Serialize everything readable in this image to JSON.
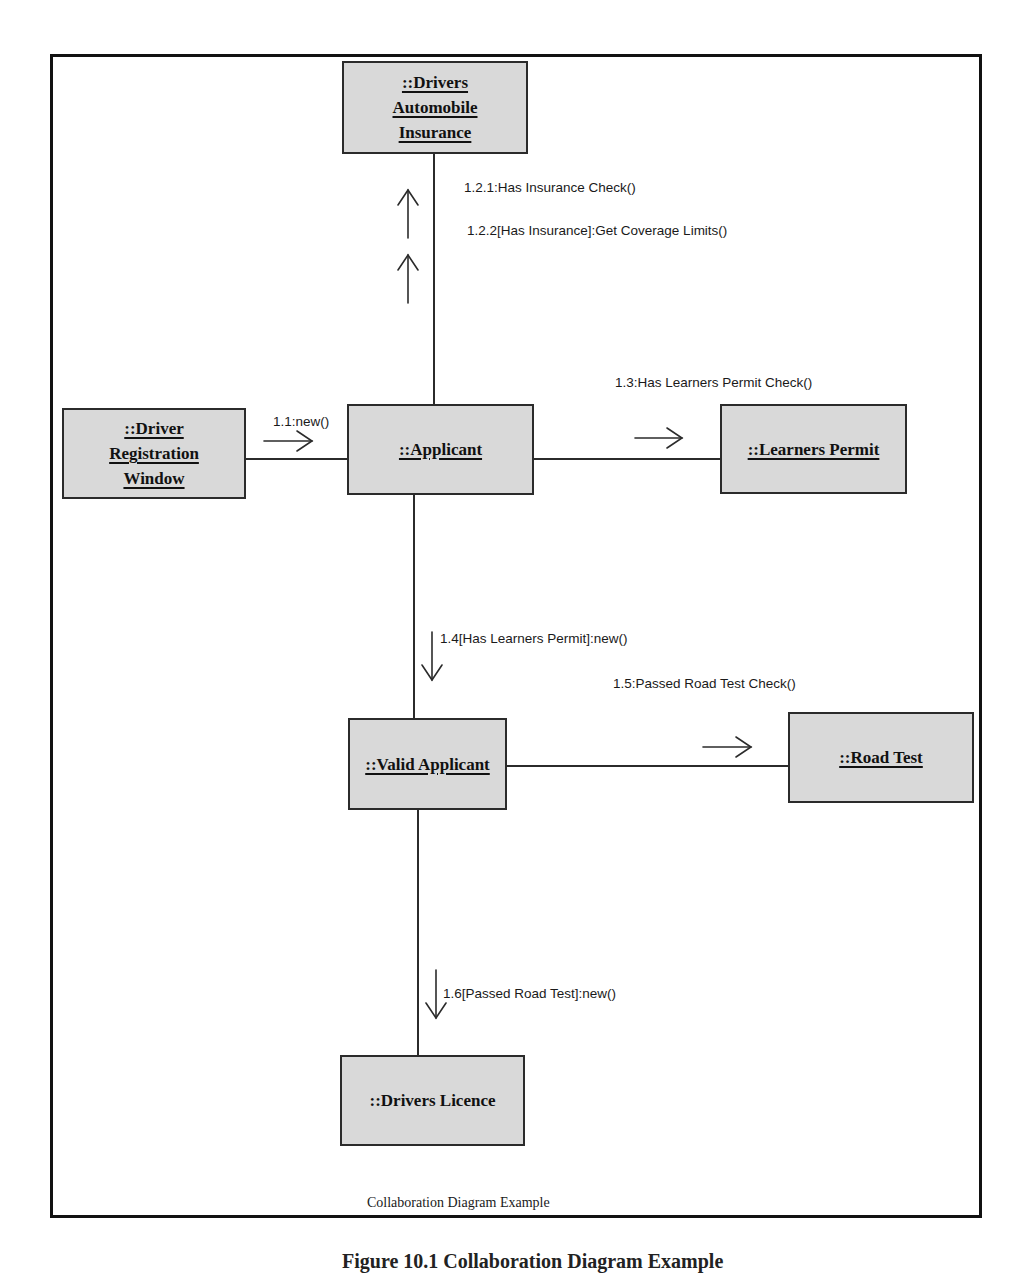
{
  "diagram": {
    "type": "UML collaboration diagram",
    "caption": "Collaboration Diagram Example",
    "figure_caption": "Figure 10.1 Collaboration Diagram Example",
    "objects": {
      "insurance": "::Drivers\nAutomobile\nInsurance",
      "registration_window": "::Driver\nRegistration\nWindow",
      "applicant": "::Applicant",
      "learners_permit": "::Learners Permit",
      "valid_applicant": "::Valid Applicant",
      "road_test": "::Road Test",
      "drivers_licence": "::Drivers Licence"
    },
    "messages": {
      "m1_1": "1.1:new()",
      "m1_2_1": "1.2.1:Has Insurance Check()",
      "m1_2_2": "1.2.2[Has Insurance]:Get Coverage Limits()",
      "m1_3": "1.3:Has Learners Permit Check()",
      "m1_4": "1.4[Has Learners Permit]:new()",
      "m1_5": "1.5:Passed Road Test Check()",
      "m1_6": "1.6[Passed Road Test]:new()"
    },
    "links": [
      {
        "from": "::Driver Registration Window",
        "to": "::Applicant",
        "message": "1.1:new()",
        "direction": "right"
      },
      {
        "from": "::Applicant",
        "to": "::Drivers Automobile Insurance",
        "message": "1.2.1:Has Insurance Check()",
        "direction": "up"
      },
      {
        "from": "::Applicant",
        "to": "::Drivers Automobile Insurance",
        "message": "1.2.2[Has Insurance]:Get Coverage Limits()",
        "direction": "up"
      },
      {
        "from": "::Applicant",
        "to": "::Learners Permit",
        "message": "1.3:Has Learners Permit Check()",
        "direction": "right"
      },
      {
        "from": "::Applicant",
        "to": "::Valid Applicant",
        "message": "1.4[Has Learners Permit]:new()",
        "direction": "down"
      },
      {
        "from": "::Valid Applicant",
        "to": "::Road Test",
        "message": "1.5:Passed Road Test Check()",
        "direction": "right"
      },
      {
        "from": "::Valid Applicant",
        "to": "::Drivers Licence",
        "message": "1.6[Passed Road Test]:new()",
        "direction": "down"
      }
    ],
    "colors": {
      "object_fill": "#d9d9d9",
      "stroke": "#2b2b2b",
      "background": "#ffffff"
    }
  }
}
